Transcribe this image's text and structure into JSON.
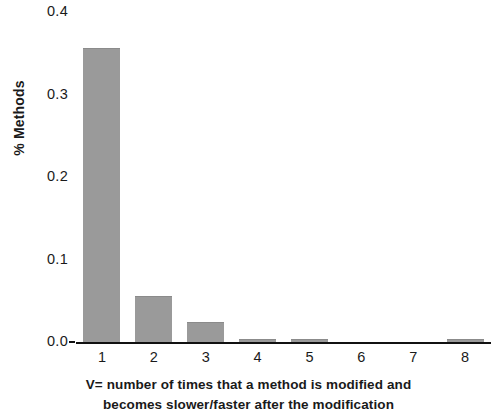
{
  "chart_data": {
    "type": "bar",
    "title": "",
    "subtitle": "",
    "xlabel": "V= number of times that a method is modified and becomes slower/faster after the modification",
    "ylabel": "% Methods",
    "categories": [
      "1",
      "2",
      "3",
      "4",
      "5",
      "6",
      "7",
      "8"
    ],
    "values": [
      0.355,
      0.054,
      0.023,
      0.003,
      0.002,
      0.0,
      0.0,
      0.002
    ],
    "series": [
      {
        "name": "% Methods",
        "values": [
          0.355,
          0.054,
          0.023,
          0.003,
          0.002,
          0.0,
          0.0,
          0.002
        ]
      }
    ],
    "ylim": [
      0.0,
      0.4
    ],
    "ytick_labels": [
      "0.4",
      "0.3",
      "0.2",
      "0.1",
      "0.0"
    ],
    "ytick_values": [
      0.4,
      0.3,
      0.2,
      0.1,
      0.0
    ],
    "xtick_labels": [
      "1",
      "2",
      "3",
      "4",
      "5",
      "6",
      "7",
      "8"
    ],
    "grid": false,
    "legend": false,
    "legend_position": "none",
    "bar_color": "#9a9a9a",
    "axis_color": "#111111",
    "background_color": "#ffffff"
  },
  "caption": {
    "line1": "V= number of times that a method is modified and",
    "line2": "becomes slower/faster after the modification"
  }
}
